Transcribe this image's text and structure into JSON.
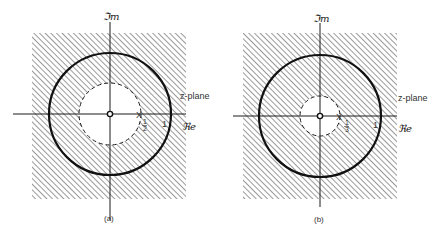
{
  "figure": {
    "panels": [
      {
        "id": "a",
        "caption": "(a)",
        "plane_label": "z-plane",
        "real_axis_label": "ℜe",
        "imag_axis_label": "ℑm",
        "pole_marker": "X",
        "pole_label_num": "1",
        "pole_label_den": "2",
        "unit_label": "1",
        "inner_radius_label": "1/2",
        "outer_radius_label": "1",
        "region": "hatched outside |z| = 1/2 (ROC |z| > 1/2)",
        "zero_at_origin": true
      },
      {
        "id": "b",
        "caption": "(b)",
        "plane_label": "z-plane",
        "real_axis_label": "ℜe",
        "imag_axis_label": "ℑm",
        "pole_marker": "X",
        "pole_label_num": "1",
        "pole_label_den": "3",
        "unit_label": "1",
        "inner_radius_label": "1/3",
        "outer_radius_label": "1",
        "region": "hatched outside |z| = 1/3 (ROC |z| > 1/3)",
        "zero_at_origin": true
      }
    ],
    "colors": {
      "ink": "#1a1a1a",
      "hatch": "#6e6e6e",
      "background": "#ffffff"
    }
  }
}
